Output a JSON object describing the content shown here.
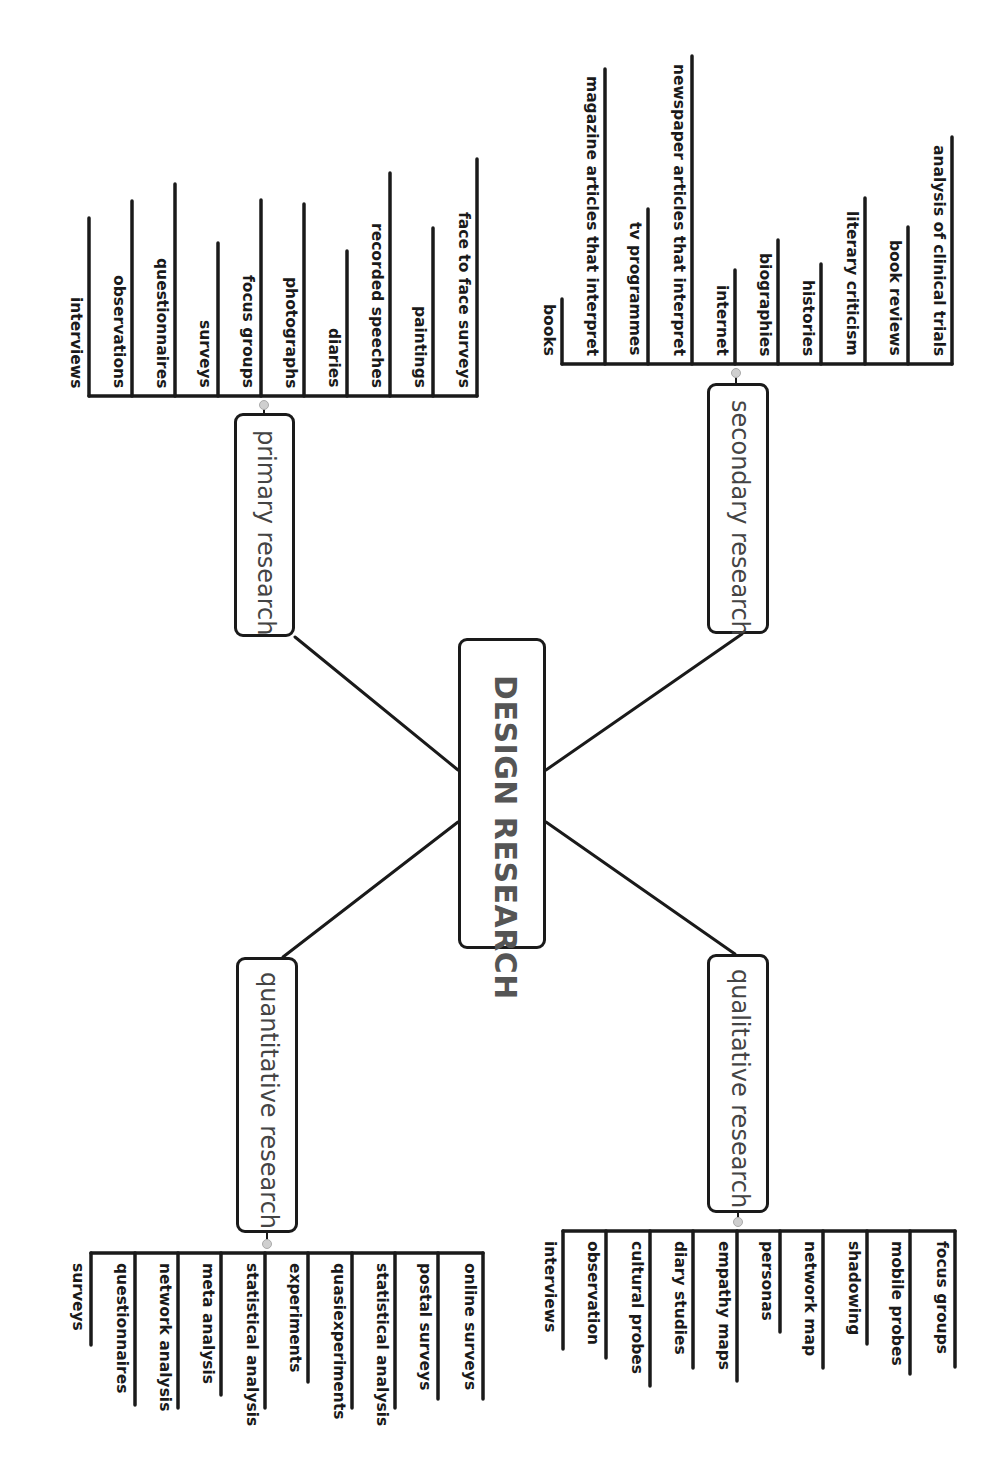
{
  "center": {
    "label": "DESIGN RESEARCH"
  },
  "branches": [
    {
      "id": "primary",
      "label": "primary research",
      "items": [
        "interviews",
        "observations",
        "questionnaires",
        "surveys",
        "focus groups",
        "photographs",
        "diaries",
        "recorded speeches",
        "paintings",
        "face to face surveys"
      ]
    },
    {
      "id": "secondary",
      "label": "secondary research",
      "items": [
        "books",
        "magazine articles that interpret",
        "tv programmes",
        "newspaper articles that interpret",
        "internet",
        "biographies",
        "histories",
        "literary criticism",
        "book reviews",
        "analysis of clinical trials"
      ]
    },
    {
      "id": "quantitative",
      "label": "quantitative research",
      "items": [
        "surveys",
        "questionnaires",
        "network analysis",
        "meta analysis",
        "statistical analysis",
        "experiments",
        "quasiexperiments",
        "statistical analysis",
        "postal surveys",
        "online surveys"
      ]
    },
    {
      "id": "qualitative",
      "label": "qualitative research",
      "items": [
        "interviews",
        "observation",
        "cultural probes",
        "diary studies",
        "empathy maps",
        "personas",
        "network map",
        "shadowing",
        "mobile probes",
        "focus groups"
      ]
    }
  ],
  "colors": {
    "stroke": "#1a1a1a",
    "center_text": "#555555",
    "branch_text": "#444444",
    "knob": "#cfcfcf"
  }
}
